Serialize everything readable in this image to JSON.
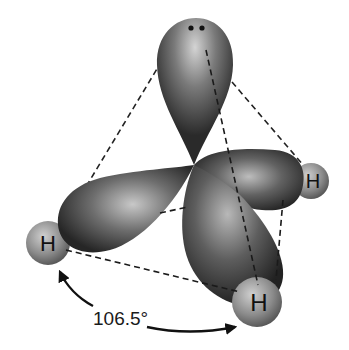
{
  "diagram": {
    "atoms": [
      {
        "id": "H-left",
        "label": "H"
      },
      {
        "id": "H-right",
        "label": "H"
      },
      {
        "id": "H-bottom",
        "label": "H"
      }
    ],
    "lone_pair": {
      "label": "lone pair",
      "dots": 2
    },
    "bond_angle": {
      "label": "106.5°",
      "between": [
        "H-left",
        "H-bottom"
      ]
    },
    "colors": {
      "lobe_dark": "#2a2a2a",
      "lobe_highlight": "#c8c8c8",
      "hydrogen": "#8a8a8a",
      "dashed_lines": "#222222",
      "background": "#ffffff"
    }
  }
}
